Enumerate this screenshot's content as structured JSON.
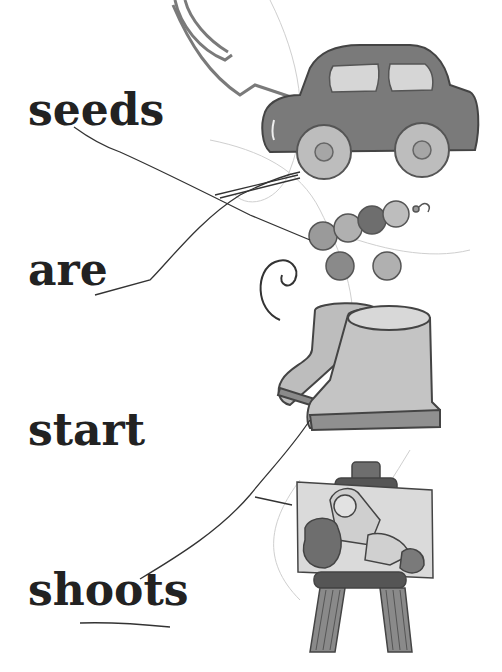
{
  "worksheet": {
    "type": "word-picture matching",
    "words": [
      {
        "label": "seeds"
      },
      {
        "label": "are"
      },
      {
        "label": "start"
      },
      {
        "label": "shoots"
      }
    ],
    "pictures": [
      {
        "name": "car"
      },
      {
        "name": "beads"
      },
      {
        "name": "boots"
      },
      {
        "name": "easel-with-painting"
      }
    ],
    "colors": {
      "ink": "#222222",
      "pencil": "#555555",
      "fill_dark": "#7a7a7a",
      "fill_light": "#c8c8c8",
      "background": "#ffffff"
    }
  }
}
